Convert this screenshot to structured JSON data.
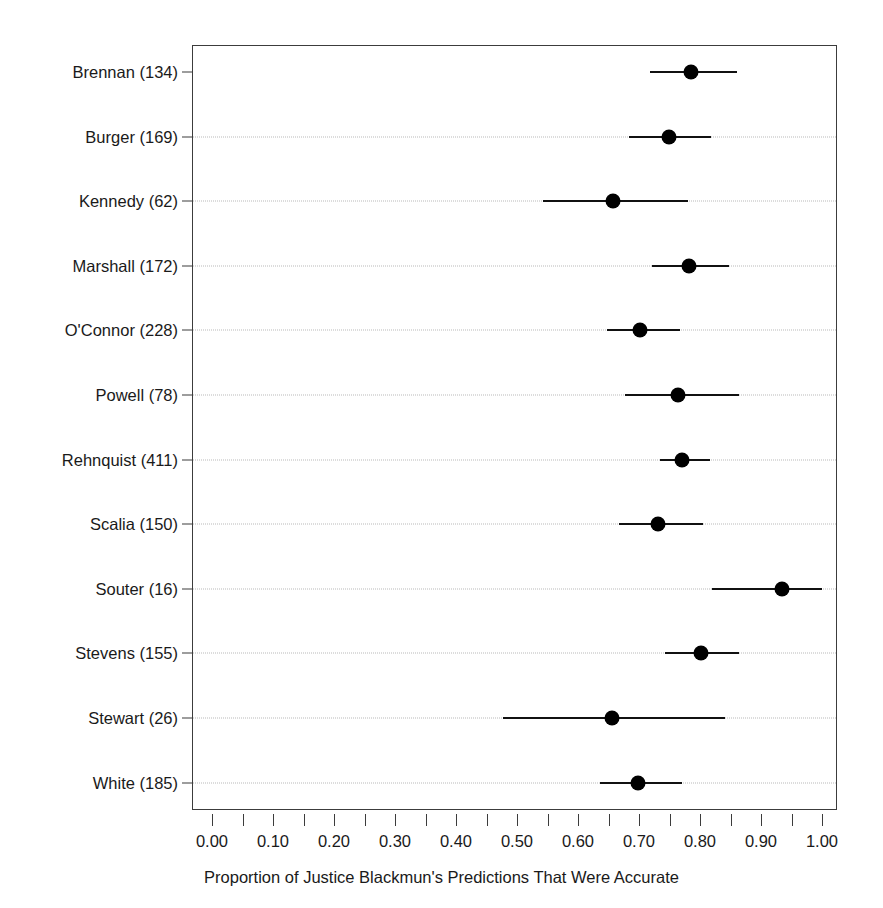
{
  "chart_data": {
    "type": "scatter",
    "orientation": "horizontal",
    "title": "",
    "xlabel": "Proportion of Justice Blackmun's  Predictions That Were Accurate",
    "ylabel": "",
    "xlim": [
      0.0,
      1.0
    ],
    "xticks": [
      0.0,
      0.05,
      0.1,
      0.15,
      0.2,
      0.25,
      0.3,
      0.35,
      0.4,
      0.45,
      0.5,
      0.55,
      0.6,
      0.65,
      0.7,
      0.75,
      0.8,
      0.85,
      0.9,
      0.95,
      1.0
    ],
    "xtick_labels": [
      "0.00",
      "",
      "0.10",
      "",
      "0.20",
      "",
      "0.30",
      "",
      "0.40",
      "",
      "0.50",
      "",
      "0.60",
      "",
      "0.70",
      "",
      "0.80",
      "",
      "0.90",
      "",
      "1.00"
    ],
    "grid": "horizontal-dotted",
    "legend": "none",
    "error_bar_style": "horizontal-line-with-point",
    "categories": [
      "Brennan (134)",
      "Burger (169)",
      "Kennedy (62)",
      "Marshall (172)",
      "O'Connor (228)",
      "Powell (78)",
      "Rehnquist (411)",
      "Scalia (150)",
      "Souter (16)",
      "Stevens (155)",
      "Stewart (26)",
      "White (185)"
    ],
    "points": [
      {
        "category": "Brennan (134)",
        "justice": "Brennan",
        "n": 134,
        "value": 0.785,
        "low": 0.718,
        "high": 0.861
      },
      {
        "category": "Burger (169)",
        "justice": "Burger",
        "n": 169,
        "value": 0.749,
        "low": 0.684,
        "high": 0.818
      },
      {
        "category": "Kennedy (62)",
        "justice": "Kennedy",
        "n": 62,
        "value": 0.657,
        "low": 0.543,
        "high": 0.78
      },
      {
        "category": "Marshall (172)",
        "justice": "Marshall",
        "n": 172,
        "value": 0.782,
        "low": 0.721,
        "high": 0.848
      },
      {
        "category": "O'Connor (228)",
        "justice": "O'Connor",
        "n": 228,
        "value": 0.702,
        "low": 0.648,
        "high": 0.767
      },
      {
        "category": "Powell (78)",
        "justice": "Powell",
        "n": 78,
        "value": 0.764,
        "low": 0.677,
        "high": 0.864
      },
      {
        "category": "Rehnquist (411)",
        "justice": "Rehnquist",
        "n": 411,
        "value": 0.77,
        "low": 0.734,
        "high": 0.816
      },
      {
        "category": "Scalia (150)",
        "justice": "Scalia",
        "n": 150,
        "value": 0.731,
        "low": 0.667,
        "high": 0.805
      },
      {
        "category": "Souter (16)",
        "justice": "Souter",
        "n": 16,
        "value": 0.934,
        "low": 0.82,
        "high": 1.0
      },
      {
        "category": "Stevens (155)",
        "justice": "Stevens",
        "n": 155,
        "value": 0.802,
        "low": 0.743,
        "high": 0.864
      },
      {
        "category": "Stewart (26)",
        "justice": "Stewart",
        "n": 26,
        "value": 0.656,
        "low": 0.477,
        "high": 0.841
      },
      {
        "category": "White (185)",
        "justice": "White",
        "n": 185,
        "value": 0.698,
        "low": 0.636,
        "high": 0.77
      }
    ],
    "colors": {
      "point": "#000000",
      "interval": "#111111",
      "frame": "#3c3c3c",
      "grid": "#b9b9b9",
      "text": "#1a1a1a",
      "background": "#ffffff"
    }
  }
}
